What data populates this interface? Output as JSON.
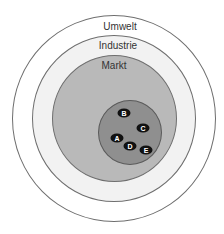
{
  "diagram": {
    "type": "nested-circles",
    "layers": [
      {
        "label": "Umwelt",
        "fill": "#ffffff",
        "stroke": "#6e6e6e"
      },
      {
        "label": "Industrie",
        "fill": "#f2f2f2",
        "stroke": "#6e6e6e"
      },
      {
        "label": "Markt",
        "fill": "#b9b9b9",
        "stroke": "#6e6e6e"
      },
      {
        "label": "",
        "fill": "#8f8f8f",
        "stroke": "#5a5a5a"
      }
    ],
    "nodes": [
      {
        "label": "B"
      },
      {
        "label": "C"
      },
      {
        "label": "A"
      },
      {
        "label": "D"
      },
      {
        "label": "E"
      }
    ]
  }
}
